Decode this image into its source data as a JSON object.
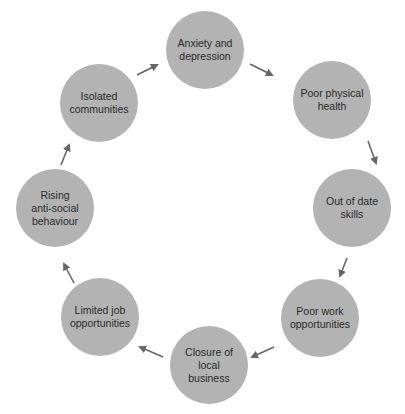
{
  "diagram": {
    "type": "cycle",
    "node_color": "#b3b3b3",
    "arrow_color": "#666666",
    "nodes": [
      {
        "label": "Anxiety and\ndepression",
        "cx": 205,
        "cy": 50
      },
      {
        "label": "Poor physical\nhealth",
        "cx": 332,
        "cy": 100
      },
      {
        "label": "Out of date\nskills",
        "cx": 352,
        "cy": 208
      },
      {
        "label": "Poor work\nopportunities",
        "cx": 320,
        "cy": 318
      },
      {
        "label": "Closure of local\nbusiness",
        "cx": 209,
        "cy": 365
      },
      {
        "label": "Limited job\nopportunities",
        "cx": 100,
        "cy": 317
      },
      {
        "label": "Rising\nanti-social\nbehaviour",
        "cx": 55,
        "cy": 208
      },
      {
        "label": "Isolated\ncommunities",
        "cx": 99,
        "cy": 103
      }
    ],
    "edges": [
      {
        "from": "Anxiety and depression",
        "to": "Poor physical health"
      },
      {
        "from": "Poor physical health",
        "to": "Out of date skills"
      },
      {
        "from": "Out of date skills",
        "to": "Poor work opportunities"
      },
      {
        "from": "Poor work opportunities",
        "to": "Closure of local business"
      },
      {
        "from": "Closure of local business",
        "to": "Limited job opportunities"
      },
      {
        "from": "Limited job opportunities",
        "to": "Rising anti-social behaviour"
      },
      {
        "from": "Rising anti-social behaviour",
        "to": "Isolated communities"
      },
      {
        "from": "Isolated communities",
        "to": "Anxiety and depression"
      }
    ]
  }
}
